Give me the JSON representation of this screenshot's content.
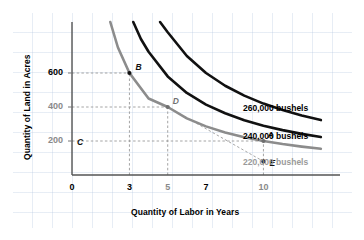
{
  "chart_data": {
    "type": "line",
    "title": "",
    "xlabel": "Quantity of Labor in Years",
    "ylabel": "Quantity of Land in Acres",
    "xlim": [
      0,
      14
    ],
    "ylim": [
      0,
      900
    ],
    "grid": true,
    "legend_position": "right-of-curve-ends",
    "xticks": [
      {
        "value": 0,
        "label": "0",
        "emphasis": "dark"
      },
      {
        "value": 3,
        "label": "3",
        "emphasis": "dark"
      },
      {
        "value": 5,
        "label": "5",
        "emphasis": "gray"
      },
      {
        "value": 7,
        "label": "7",
        "emphasis": "dark"
      },
      {
        "value": 10,
        "label": "10",
        "emphasis": "gray"
      }
    ],
    "yticks": [
      {
        "value": 200,
        "label": "200",
        "emphasis": "gray"
      },
      {
        "value": 400,
        "label": "400",
        "emphasis": "gray"
      },
      {
        "value": 600,
        "label": "600",
        "emphasis": "dark"
      }
    ],
    "series": [
      {
        "name": "220,000 bushels",
        "label": "220,000 bushels",
        "color": "#8c8c8c",
        "isoquant_constant": 1800,
        "x": [
          2.0,
          2.4,
          3.0,
          4.0,
          5.0,
          6.0,
          7.0,
          8.0,
          9.0,
          10.0,
          11.0,
          12.0,
          13.0
        ],
        "y": [
          900,
          750,
          600,
          450,
          400,
          333,
          286,
          250,
          222,
          200,
          182,
          167,
          154
        ]
      },
      {
        "name": "240,000 bushels",
        "label": "240,000 bushels",
        "color": "#111111",
        "isoquant_constant": 2900,
        "x": [
          3.2,
          3.6,
          4.0,
          5.0,
          6.0,
          7.0,
          8.0,
          9.0,
          10.0,
          11.0,
          12.0,
          13.0
        ],
        "y": [
          900,
          800,
          725,
          580,
          483,
          414,
          363,
          322,
          290,
          264,
          242,
          223
        ]
      },
      {
        "name": "260,000 bushels",
        "label": "260,000 bushels",
        "color": "#111111",
        "isoquant_constant": 4200,
        "x": [
          4.6,
          5.0,
          6.0,
          7.0,
          8.0,
          9.0,
          10.0,
          11.0,
          12.0,
          13.0
        ],
        "y": [
          900,
          840,
          700,
          600,
          525,
          467,
          420,
          382,
          350,
          323
        ]
      }
    ],
    "points": [
      {
        "id": "B",
        "label": "B",
        "x": 3,
        "y": 600,
        "marker": "dot-dark",
        "label_color": "dark",
        "label_dx": 6,
        "label_dy": -11,
        "on_curve": "220,000 bushels"
      },
      {
        "id": "D",
        "label": "D",
        "x": 5,
        "y": 400,
        "marker": "dot-gray",
        "label_color": "gray",
        "label_dx": 5,
        "label_dy": -11,
        "on_curve": "220,000 bushels"
      },
      {
        "id": "A",
        "label": "A",
        "x": 10,
        "y": 200,
        "marker": "dot-gray",
        "label_color": "dark",
        "label_dx": 4,
        "label_dy": -11,
        "on_curve": "220,000 bushels"
      },
      {
        "id": "E",
        "label": "E",
        "x": 10,
        "y": 80,
        "marker": "dot-dark",
        "label_color": "dark",
        "label_dx": 6,
        "label_dy": -3,
        "on_curve": ""
      },
      {
        "id": "C",
        "label": "C",
        "x": 0,
        "y": 200,
        "marker": "none",
        "label_color": "dark",
        "label_dx": 5,
        "label_dy": -4,
        "on_curve": ""
      }
    ],
    "annotations": [
      {
        "type": "dashed-guide",
        "from": "y-axis",
        "to_point": "B",
        "note": "horizontal guide at 600 to point B"
      },
      {
        "type": "dashed-guide",
        "from": "x-axis",
        "to_point": "B",
        "note": "vertical guide at x=3 up to point B"
      },
      {
        "type": "dashed-guide",
        "from": "y-axis",
        "to_point": "D",
        "note": "horizontal guide at 400 to point D"
      },
      {
        "type": "dashed-guide",
        "from": "x-axis",
        "to_point": "D",
        "note": "vertical guide at x=5 up to point D"
      },
      {
        "type": "dashed-guide",
        "from": "y-axis",
        "to_point": "A",
        "note": "horizontal guide at 200 to point A"
      },
      {
        "type": "dashed-guide",
        "from": "x-axis",
        "to_point": "E",
        "note": "vertical guide at x=10 up through A"
      },
      {
        "type": "dashed-segment",
        "from_point": "D",
        "to_point": "E",
        "note": "slope segment from D to E"
      }
    ]
  }
}
